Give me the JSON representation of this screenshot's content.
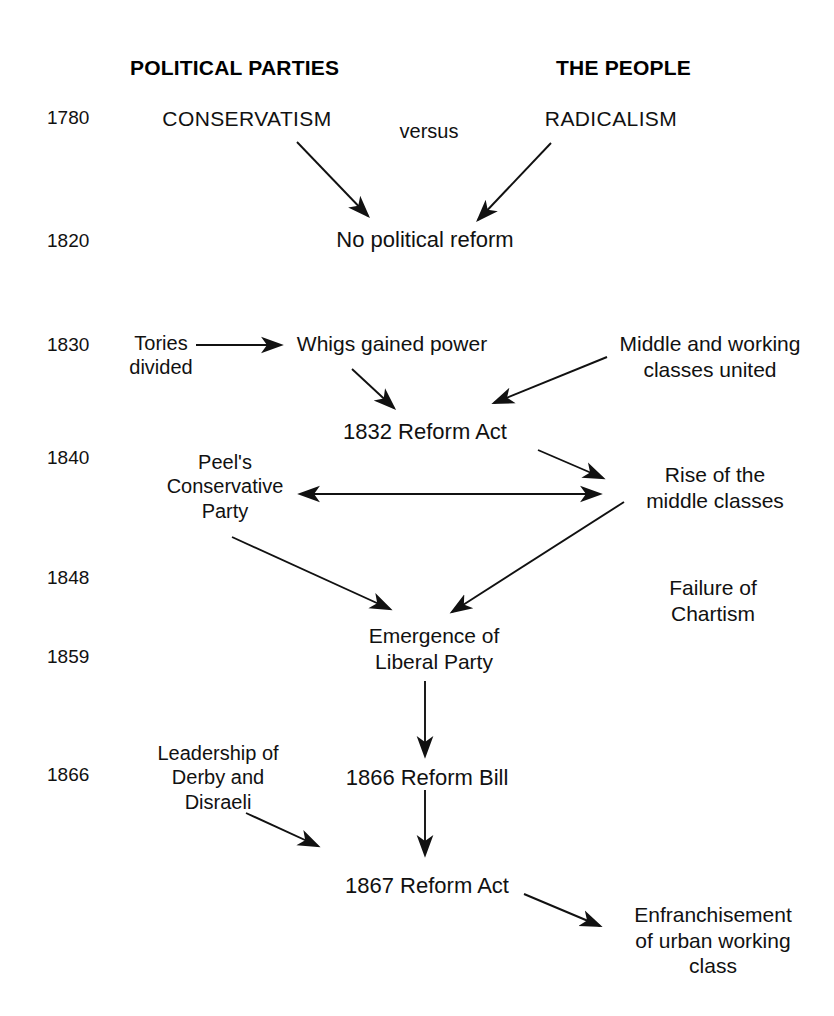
{
  "diagram": {
    "title_columns": [
      {
        "id": "political-parties",
        "label": "POLITICAL PARTIES",
        "x": 130,
        "y": 56
      },
      {
        "id": "the-people",
        "label": "THE PEOPLE",
        "x": 556,
        "y": 56
      }
    ],
    "years": [
      {
        "label": "1780",
        "x": 47,
        "y": 107
      },
      {
        "label": "1820",
        "x": 47,
        "y": 230
      },
      {
        "label": "1830",
        "x": 47,
        "y": 334
      },
      {
        "label": "1840",
        "x": 47,
        "y": 447
      },
      {
        "label": "1848",
        "x": 578,
        "y": 0,
        "x_left": 47,
        "y_top": 567
      },
      {
        "label": "1859",
        "x": 47,
        "y": 646
      },
      {
        "label": "1866",
        "x": 47,
        "y": 764
      }
    ],
    "nodes": [
      {
        "id": "conservatism",
        "text": "CONSERVATISM",
        "cx": 247,
        "y": 106,
        "size": 21,
        "style": "caps"
      },
      {
        "id": "versus",
        "text": "versus",
        "cx": 429,
        "y": 119,
        "size": 20,
        "style": "normal"
      },
      {
        "id": "radicalism",
        "text": "RADICALISM",
        "cx": 611,
        "y": 106,
        "size": 21,
        "style": "caps"
      },
      {
        "id": "no-political-reform",
        "text": "No political reform",
        "cx": 425,
        "y": 227,
        "size": 22,
        "style": "normal"
      },
      {
        "id": "tories-divided",
        "text": "Tories\ndivided",
        "cx": 161,
        "y": 331,
        "size": 20,
        "style": "normal"
      },
      {
        "id": "whigs-gained-power",
        "text": "Whigs gained power",
        "cx": 392,
        "y": 331,
        "size": 21,
        "style": "normal"
      },
      {
        "id": "middle-working-classes-united",
        "text": "Middle and working\nclasses united",
        "cx": 710,
        "y": 331,
        "size": 21,
        "style": "normal"
      },
      {
        "id": "reform-act-1832",
        "text": "1832 Reform Act",
        "cx": 425,
        "y": 419,
        "size": 22,
        "style": "normal"
      },
      {
        "id": "peels-conservative-party",
        "text": "Peel's\nConservative\nParty",
        "cx": 225,
        "y": 450,
        "size": 20,
        "style": "normal"
      },
      {
        "id": "rise-of-middle-classes",
        "text": "Rise of the\nmiddle classes",
        "cx": 715,
        "y": 462,
        "size": 21,
        "style": "normal"
      },
      {
        "id": "failure-of-chartism",
        "text": "Failure of\nChartism",
        "cx": 713,
        "y": 575,
        "size": 21,
        "style": "normal"
      },
      {
        "id": "emergence-liberal-party",
        "text": "Emergence of\nLiberal Party",
        "cx": 434,
        "y": 623,
        "size": 21,
        "style": "normal"
      },
      {
        "id": "leadership-derby-disraeli",
        "text": "Leadership of\nDerby and\nDisraeli",
        "cx": 218,
        "y": 741,
        "size": 20,
        "style": "normal"
      },
      {
        "id": "reform-bill-1866",
        "text": "1866 Reform Bill",
        "cx": 427,
        "y": 765,
        "size": 22,
        "style": "normal"
      },
      {
        "id": "reform-act-1867",
        "text": "1867 Reform Act",
        "cx": 427,
        "y": 873,
        "size": 22,
        "style": "normal"
      },
      {
        "id": "enfranchisement-urban-working-class",
        "text": "Enfranchisement\nof urban working\nclass",
        "cx": 713,
        "y": 902,
        "size": 21,
        "style": "normal"
      }
    ],
    "arrows": [
      {
        "id": "conservatism-to-no-reform",
        "from": [
          297,
          142
        ],
        "to": [
          368,
          216
        ],
        "double": false
      },
      {
        "id": "radicalism-to-no-reform",
        "from": [
          551,
          143
        ],
        "to": [
          478,
          220
        ],
        "double": false
      },
      {
        "id": "tories-to-whigs",
        "from": [
          196,
          345
        ],
        "to": [
          281,
          345
        ],
        "double": false
      },
      {
        "id": "whigs-to-1832",
        "from": [
          352,
          369
        ],
        "to": [
          394,
          408
        ],
        "double": false
      },
      {
        "id": "classes-to-1832",
        "from": [
          607,
          357
        ],
        "to": [
          494,
          403
        ],
        "double": false
      },
      {
        "id": "1832-to-rise",
        "from": [
          538,
          450
        ],
        "to": [
          603,
          478
        ],
        "double": false
      },
      {
        "id": "peel-rise-exchange",
        "from": [
          300,
          494
        ],
        "to": [
          600,
          494
        ],
        "double": true
      },
      {
        "id": "peel-to-emergence",
        "from": [
          232,
          537
        ],
        "to": [
          390,
          609
        ],
        "double": false
      },
      {
        "id": "rise-to-emergence",
        "from": [
          624,
          502
        ],
        "to": [
          452,
          612
        ],
        "double": false
      },
      {
        "id": "emergence-to-1866-bill",
        "from": [
          425,
          681
        ],
        "to": [
          425,
          756
        ],
        "double": false
      },
      {
        "id": "disraeli-to-1867",
        "from": [
          246,
          813
        ],
        "to": [
          318,
          846
        ],
        "double": false
      },
      {
        "id": "1866-bill-to-1867-act",
        "from": [
          425,
          790
        ],
        "to": [
          425,
          855
        ],
        "double": false
      },
      {
        "id": "1867-to-enfranchisement",
        "from": [
          524,
          894
        ],
        "to": [
          600,
          926
        ],
        "double": false
      }
    ],
    "colors": {
      "ink": "#111111",
      "background": "#ffffff"
    }
  }
}
